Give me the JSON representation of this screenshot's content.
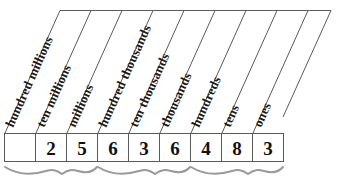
{
  "diagram": {
    "type": "place-value-chart",
    "colors": {
      "line": "#5a5a5a",
      "brace": "#9a9a9a",
      "text": "#111111",
      "background": "#ffffff"
    },
    "columns": [
      {
        "label": "hundred millions",
        "digit": ""
      },
      {
        "label": "ten millions",
        "digit": "2"
      },
      {
        "label": "millions",
        "digit": "5"
      },
      {
        "label": "hundred thousands",
        "digit": "6"
      },
      {
        "label": "ten thousands",
        "digit": "3"
      },
      {
        "label": "thousands",
        "digit": "6"
      },
      {
        "label": "hundreds",
        "digit": "4"
      },
      {
        "label": "tens",
        "digit": "8"
      },
      {
        "label": "ones",
        "digit": "3"
      }
    ],
    "groups": [
      {
        "name": "millions-period",
        "columns": [
          0,
          1,
          2
        ]
      },
      {
        "name": "thousands-period",
        "columns": [
          3,
          4,
          5
        ]
      },
      {
        "name": "ones-period",
        "columns": [
          6,
          7,
          8
        ]
      }
    ],
    "number_value": "25,636,483"
  }
}
